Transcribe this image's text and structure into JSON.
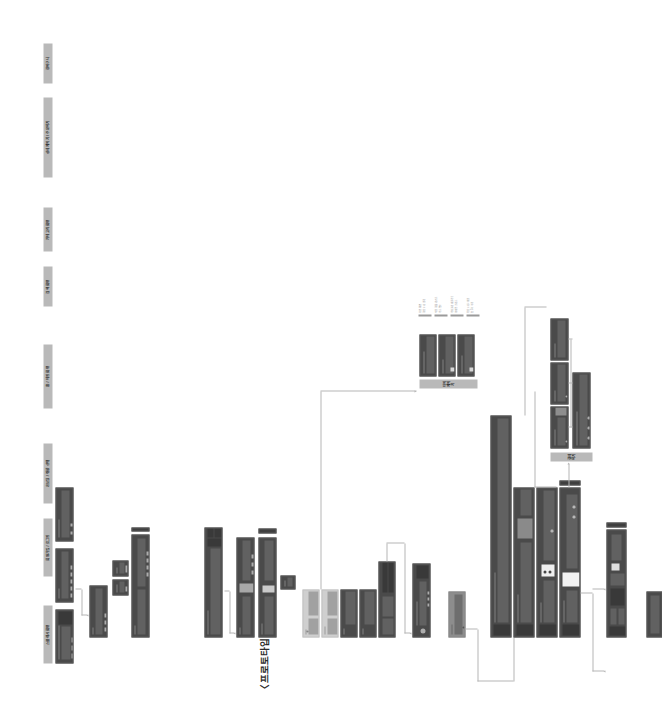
{
  "document": {
    "title": "〈프로토타입 만들기〉",
    "orientation": "rotated-90-ccw",
    "accent_label_bg": "#b9b9b9",
    "screen_bg": "#4a4a4a",
    "connector_color": "#b5b5b5",
    "page_bg": "#ffffff"
  },
  "sections": [
    {
      "id": "sec-splash",
      "label": "스플래시 화면",
      "screens": [
        {
          "name": "splash-1",
          "kind": "dark"
        },
        {
          "name": "splash-2",
          "kind": "dark"
        },
        {
          "name": "splash-3",
          "kind": "dark"
        }
      ]
    },
    {
      "id": "sec-login",
      "label": "회원가입 / 로그인",
      "screens": [
        {
          "name": "login-main",
          "kind": "dark"
        },
        {
          "name": "login-modal-a",
          "kind": "dark"
        },
        {
          "name": "login-modal-b",
          "kind": "dark"
        },
        {
          "name": "signup-form",
          "kind": "dark"
        }
      ]
    },
    {
      "id": "sec-onboarding",
      "label": "온보딩 / 취향 선택",
      "screens": [
        {
          "name": "onboarding-wide",
          "kind": "dark"
        },
        {
          "name": "onboarding-step-2",
          "kind": "dark"
        },
        {
          "name": "onboarding-step-3",
          "kind": "dark"
        },
        {
          "name": "onboarding-small",
          "kind": "dark"
        }
      ]
    },
    {
      "id": "sec-home",
      "label": "홈 / 메인 화면",
      "screens": [
        {
          "name": "home-1",
          "kind": "light"
        },
        {
          "name": "home-2",
          "kind": "light"
        },
        {
          "name": "home-3",
          "kind": "dark"
        },
        {
          "name": "home-4",
          "kind": "dark"
        },
        {
          "name": "home-detail",
          "kind": "dark"
        }
      ]
    },
    {
      "id": "sec-search",
      "label": "검색 화면",
      "screens": [
        {
          "name": "search-main",
          "kind": "dark"
        }
      ]
    },
    {
      "id": "sec-category",
      "label": "카테고리 화면",
      "screens": [
        {
          "name": "category-main",
          "kind": "dark"
        }
      ]
    },
    {
      "id": "sec-detail",
      "label": "상세 페이지 / 주문하기",
      "screens": [
        {
          "name": "detail-row-1",
          "kind": "dark"
        },
        {
          "name": "detail-row-2",
          "kind": "dark"
        },
        {
          "name": "detail-row-3",
          "kind": "dark"
        },
        {
          "name": "detail-row-4",
          "kind": "dark"
        }
      ]
    },
    {
      "id": "sec-cart",
      "label": "장바구니",
      "screens": [
        {
          "name": "cart-main",
          "kind": "dark"
        },
        {
          "name": "cart-extra",
          "kind": "dark"
        }
      ]
    },
    {
      "id": "sec-mypage",
      "label": "마이 페이지",
      "screens": [
        {
          "name": "mypage-1",
          "kind": "dark"
        },
        {
          "name": "mypage-2",
          "kind": "dark"
        },
        {
          "name": "mypage-3",
          "kind": "dark"
        }
      ]
    },
    {
      "id": "sec-payment",
      "label": "결제하기",
      "screens": [
        {
          "name": "payment-1",
          "kind": "dark"
        },
        {
          "name": "payment-2",
          "kind": "dark"
        },
        {
          "name": "payment-3",
          "kind": "dark"
        },
        {
          "name": "payment-4",
          "kind": "dark"
        }
      ]
    }
  ],
  "legend": {
    "name": "legend-list",
    "rows": [
      {
        "name": "legend-row-1",
        "text": "메인 화면\n상단 배너 영역"
      },
      {
        "name": "legend-row-2",
        "text": "추천 상품 리스트\n카드 형태"
      },
      {
        "name": "legend-row-3",
        "text": "카테고리 바로가기\n아이콘 그리드"
      },
      {
        "name": "legend-row-4",
        "text": "하단 네비게이션\n탭 5개 구성"
      }
    ]
  }
}
